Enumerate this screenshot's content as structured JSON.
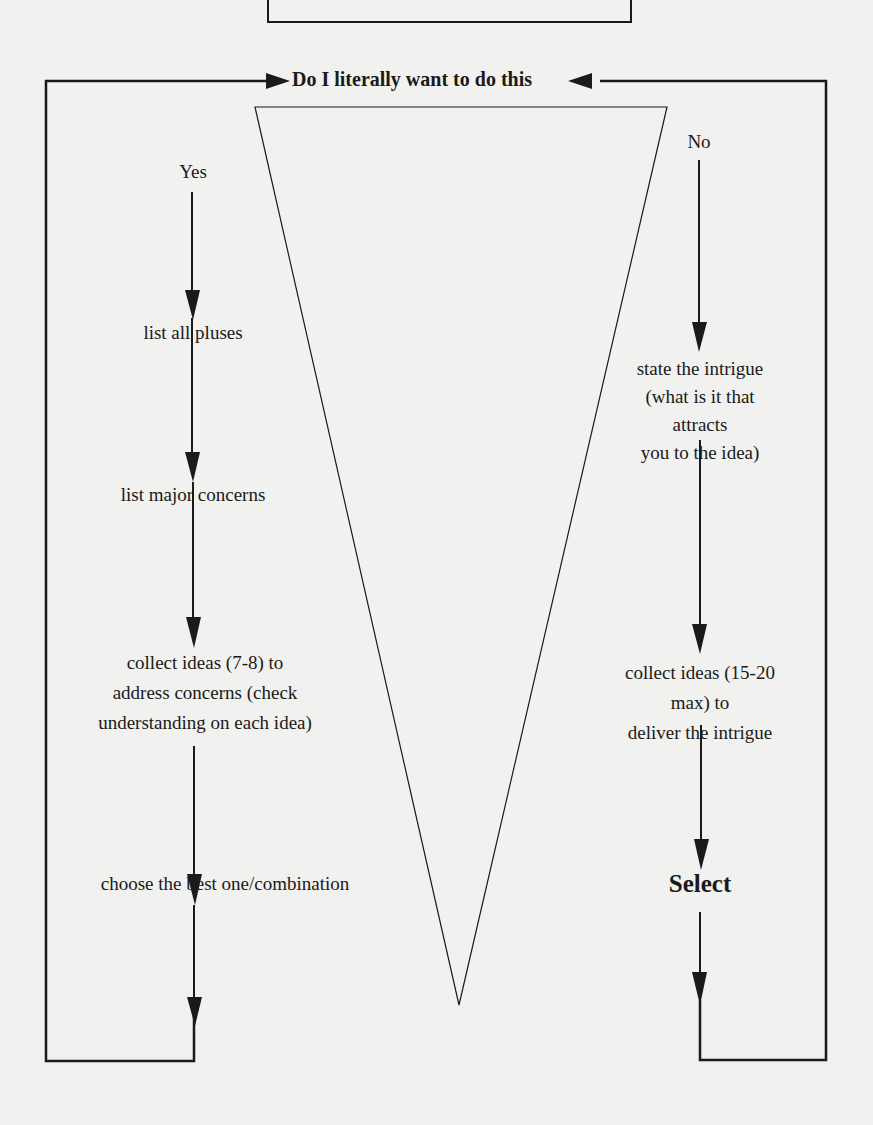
{
  "diagram": {
    "title": "Do I literally want to do this",
    "yes_branch": {
      "label": "Yes",
      "steps": [
        "list all pluses",
        "list major concerns",
        "collect ideas (7-8) to\naddress concerns (check\nunderstanding on each idea)",
        "choose the best one/combination"
      ]
    },
    "no_branch": {
      "label": "No",
      "steps": [
        "state the intrigue\n(what is it that\nattracts\nyou to the idea)",
        "collect ideas (15-20 max) to\ndeliver the intrigue",
        "Select"
      ]
    },
    "colors": {
      "line": "#1a1a1a",
      "background": "#f1f1ef"
    }
  }
}
